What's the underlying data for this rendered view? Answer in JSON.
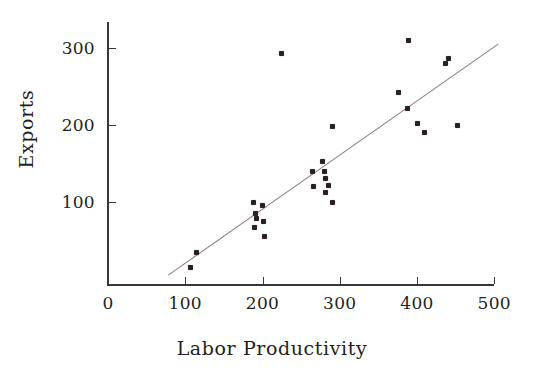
{
  "chart_data": {
    "type": "scatter",
    "title": "",
    "xlabel": "Labor Productivity",
    "ylabel": "Exports",
    "xlim": [
      0,
      500
    ],
    "ylim": [
      0,
      330
    ],
    "xticks": [
      0,
      100,
      200,
      300,
      400,
      500
    ],
    "yticks": [
      100,
      200,
      300
    ],
    "xtick_labels": [
      "0",
      "100",
      "200",
      "300",
      "400",
      "500"
    ],
    "ytick_labels": [
      "100",
      "200",
      "300"
    ],
    "grid": false,
    "legend": null,
    "series": [
      {
        "name": "Observations",
        "marker": "square-dot",
        "color": "#2b1f26",
        "points": [
          [
            107,
            15
          ],
          [
            115,
            35
          ],
          [
            188,
            100
          ],
          [
            191,
            85
          ],
          [
            192,
            78
          ],
          [
            190,
            67
          ],
          [
            200,
            95
          ],
          [
            201,
            75
          ],
          [
            203,
            55
          ],
          [
            224,
            293
          ],
          [
            265,
            140
          ],
          [
            266,
            120
          ],
          [
            278,
            153
          ],
          [
            280,
            139
          ],
          [
            281,
            131
          ],
          [
            282,
            112
          ],
          [
            286,
            122
          ],
          [
            290,
            100
          ],
          [
            290,
            198
          ],
          [
            376,
            242
          ],
          [
            388,
            222
          ],
          [
            389,
            310
          ],
          [
            401,
            202
          ],
          [
            410,
            190
          ],
          [
            437,
            280
          ],
          [
            441,
            286
          ],
          [
            452,
            200
          ]
        ]
      }
    ],
    "fit_line": {
      "name": "Regression line",
      "color": "#8a8078",
      "x_start": 78,
      "y_start": 5,
      "x_end": 505,
      "y_end": 305
    }
  }
}
